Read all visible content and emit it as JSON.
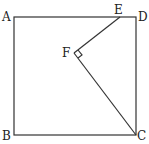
{
  "diagram": {
    "type": "geometry",
    "points": {
      "A": {
        "label": "A",
        "x": 14,
        "y": 17
      },
      "B": {
        "label": "B",
        "x": 14,
        "y": 135
      },
      "C": {
        "label": "C",
        "x": 136,
        "y": 135
      },
      "D": {
        "label": "D",
        "x": 136,
        "y": 17
      },
      "E": {
        "label": "E",
        "x": 120,
        "y": 17
      },
      "F": {
        "label": "F",
        "x": 74,
        "y": 53
      }
    },
    "segments": [
      "AB",
      "BC",
      "CD",
      "DA",
      "EF",
      "FC"
    ],
    "right_angle_at": "F",
    "colors": {
      "stroke": "#333333",
      "background": "#ffffff"
    }
  }
}
